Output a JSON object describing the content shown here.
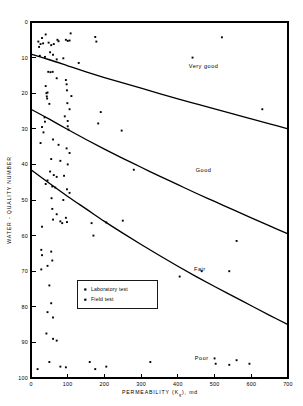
{
  "chart_data": {
    "type": "scatter",
    "title": "",
    "xlabel": "PERMEABILITY (K",
    "xlabel_sub": "g",
    "xlabel_tail": "), md",
    "xlabel_full": "PERMEABILITY (Kg), md",
    "ylabel": "WATER - QUALITY NUMBER",
    "xlim": [
      0,
      700
    ],
    "ylim": [
      0,
      100
    ],
    "y_inverted": true,
    "grid": false,
    "xticks": [
      0,
      100,
      200,
      300,
      400,
      500,
      600,
      700
    ],
    "xtick_labels": [
      "0",
      "100",
      "200",
      "300",
      "400",
      "500",
      "600",
      "700"
    ],
    "yticks": [
      0,
      10,
      20,
      30,
      40,
      50,
      60,
      70,
      80,
      90,
      100
    ],
    "ytick_labels": [
      "0",
      "10",
      "20",
      "30",
      "40",
      "50",
      "60",
      "70",
      "80",
      "90",
      "100"
    ],
    "legend": {
      "position": "center-left",
      "entries": [
        {
          "label": "Laboratory test",
          "marker": "square"
        },
        {
          "label": "Field test",
          "marker": "square"
        }
      ]
    },
    "annotations": [
      {
        "text": "Very good",
        "x": 470,
        "y": 13
      },
      {
        "text": "Good",
        "x": 470,
        "y": 42
      },
      {
        "text": "Fair",
        "x": 460,
        "y": 70
      },
      {
        "text": "Poor",
        "x": 465,
        "y": 95
      }
    ],
    "boundary_curves": [
      {
        "name": "very-good-good-boundary",
        "points": [
          [
            0,
            9.0
          ],
          [
            50,
            10.6
          ],
          [
            100,
            12.3
          ],
          [
            150,
            14.0
          ],
          [
            200,
            15.6
          ],
          [
            250,
            17.1
          ],
          [
            300,
            18.6
          ],
          [
            350,
            20.1
          ],
          [
            400,
            21.6
          ],
          [
            450,
            23.0
          ],
          [
            500,
            24.4
          ],
          [
            550,
            25.8
          ],
          [
            600,
            27.2
          ],
          [
            650,
            28.6
          ],
          [
            700,
            30.0
          ]
        ]
      },
      {
        "name": "good-fair-boundary",
        "points": [
          [
            0,
            24.5
          ],
          [
            50,
            27.3
          ],
          [
            100,
            30.2
          ],
          [
            150,
            33.0
          ],
          [
            200,
            35.7
          ],
          [
            250,
            38.3
          ],
          [
            300,
            40.8
          ],
          [
            350,
            43.3
          ],
          [
            400,
            45.7
          ],
          [
            450,
            48.1
          ],
          [
            500,
            50.4
          ],
          [
            550,
            52.7
          ],
          [
            600,
            55.0
          ],
          [
            650,
            57.3
          ],
          [
            700,
            59.5
          ]
        ]
      },
      {
        "name": "fair-poor-boundary",
        "points": [
          [
            0,
            41.5
          ],
          [
            50,
            45.3
          ],
          [
            100,
            49.0
          ],
          [
            150,
            52.5
          ],
          [
            200,
            56.0
          ],
          [
            250,
            59.3
          ],
          [
            300,
            62.5
          ],
          [
            350,
            65.6
          ],
          [
            400,
            68.6
          ],
          [
            450,
            71.5
          ],
          [
            500,
            74.3
          ],
          [
            550,
            77.0
          ],
          [
            600,
            79.7
          ],
          [
            650,
            82.4
          ],
          [
            700,
            85.0
          ]
        ]
      }
    ],
    "series": [
      {
        "name": "Laboratory test",
        "marker": "square",
        "points": [
          [
            20,
            5.5
          ],
          [
            26,
            6.2
          ],
          [
            30,
            4.5
          ],
          [
            33,
            6.0
          ],
          [
            22,
            7.0
          ],
          [
            40,
            3.5
          ],
          [
            48,
            5.8
          ],
          [
            55,
            6.5
          ],
          [
            62,
            6.2
          ],
          [
            72,
            5.0
          ],
          [
            75,
            5.4
          ],
          [
            95,
            5.0
          ],
          [
            100,
            5.3
          ],
          [
            105,
            5.2
          ],
          [
            108,
            3.2
          ],
          [
            175,
            4.2
          ],
          [
            178,
            5.5
          ],
          [
            520,
            4.3
          ],
          [
            24,
            9.5
          ],
          [
            38,
            9.8
          ],
          [
            52,
            8.5
          ],
          [
            60,
            9.2
          ],
          [
            70,
            10.5
          ],
          [
            88,
            10.2
          ],
          [
            130,
            11.5
          ],
          [
            440,
            10.0
          ],
          [
            47,
            14.0
          ],
          [
            53,
            14.1
          ],
          [
            59,
            14.0
          ],
          [
            70,
            15.8
          ],
          [
            95,
            16.3
          ],
          [
            97,
            17.5
          ],
          [
            40,
            18.0
          ],
          [
            45,
            19.8
          ],
          [
            98,
            19.2
          ],
          [
            110,
            20.8
          ],
          [
            42,
            20.0
          ],
          [
            43,
            20.9
          ],
          [
            44,
            21.5
          ],
          [
            50,
            23.0
          ],
          [
            99,
            22.8
          ],
          [
            105,
            24.5
          ],
          [
            190,
            25.3
          ],
          [
            630,
            24.5
          ],
          [
            37,
            26.8
          ],
          [
            38,
            28.0
          ],
          [
            92,
            26.5
          ],
          [
            100,
            27.8
          ],
          [
            183,
            28.5
          ],
          [
            30,
            29.5
          ],
          [
            34,
            31.0
          ],
          [
            100,
            29.3
          ],
          [
            102,
            30.2
          ],
          [
            247,
            30.5
          ],
          [
            26,
            34.0
          ],
          [
            60,
            33.0
          ],
          [
            75,
            34.5
          ],
          [
            97,
            35.5
          ],
          [
            105,
            36.8
          ],
          [
            55,
            38.5
          ],
          [
            80,
            39.0
          ],
          [
            100,
            40.0
          ],
          [
            280,
            41.5
          ],
          [
            52,
            42.0
          ],
          [
            62,
            43.0
          ],
          [
            70,
            43.5
          ],
          [
            90,
            43.2
          ],
          [
            45,
            44.5
          ],
          [
            40,
            45.5
          ],
          [
            58,
            46.2
          ],
          [
            66,
            46.5
          ],
          [
            98,
            47.0
          ],
          [
            105,
            48.0
          ],
          [
            56,
            49.5
          ],
          [
            88,
            50.0
          ],
          [
            58,
            52.5
          ],
          [
            70,
            54.0
          ],
          [
            95,
            55.0
          ],
          [
            60,
            55.5
          ],
          [
            80,
            56.0
          ],
          [
            85,
            56.5
          ],
          [
            98,
            56.2
          ],
          [
            165,
            56.5
          ],
          [
            205,
            56.3
          ],
          [
            250,
            55.8
          ],
          [
            30,
            57.5
          ],
          [
            170,
            60.0
          ],
          [
            560,
            61.5
          ],
          [
            28,
            64.0
          ],
          [
            30,
            65.5
          ],
          [
            55,
            64.5
          ],
          [
            58,
            67.0
          ],
          [
            45,
            68.5
          ],
          [
            28,
            69.5
          ],
          [
            465,
            70.0
          ],
          [
            540,
            70.0
          ],
          [
            405,
            71.5
          ],
          [
            50,
            74.0
          ],
          [
            55,
            79.0
          ],
          [
            45,
            81.5
          ],
          [
            60,
            83.0
          ],
          [
            42,
            87.5
          ],
          [
            60,
            89.0
          ],
          [
            70,
            89.5
          ]
        ]
      },
      {
        "name": "Field test",
        "marker": "square",
        "points": [
          [
            18,
            97.5
          ],
          [
            50,
            95.5
          ],
          [
            80,
            96.8
          ],
          [
            95,
            97.0
          ],
          [
            160,
            95.5
          ],
          [
            175,
            97.5
          ],
          [
            205,
            96.8
          ],
          [
            325,
            95.5
          ],
          [
            500,
            94.5
          ],
          [
            503,
            96.0
          ],
          [
            540,
            96.3
          ],
          [
            560,
            95.0
          ],
          [
            595,
            96.0
          ]
        ]
      }
    ]
  },
  "plot_geometry": {
    "left_px": 31,
    "right_px": 288,
    "top_px": 22,
    "bottom_px": 378
  },
  "legend_panel": {
    "row1_label": "Laboratory test",
    "row2_label": "Field test"
  },
  "labels": {
    "very_good": "Very good",
    "good": "Good",
    "fair": "Fair",
    "poor": "Poor",
    "y_axis_title": "WATER - QUALITY NUMBER",
    "x_axis_title_main": "PERMEABILITY (K",
    "x_axis_title_sub": "g",
    "x_axis_title_end": "), md"
  }
}
